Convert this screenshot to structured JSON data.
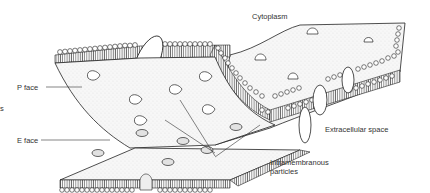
{
  "diagram": {
    "labels": {
      "cytoplasm": "Cytoplasm",
      "p_face": "P face",
      "e_face": "E face",
      "extracellular_space": "Extracellular space",
      "intramembranous_particles_line1": "Intramembranous",
      "intramembranous_particles_line2": "particles",
      "cropped_left_text": "s"
    },
    "colors": {
      "line": "#222222",
      "surface": "#f4f4f4",
      "stipple": "#bdbdbd",
      "text": "#333333"
    }
  }
}
